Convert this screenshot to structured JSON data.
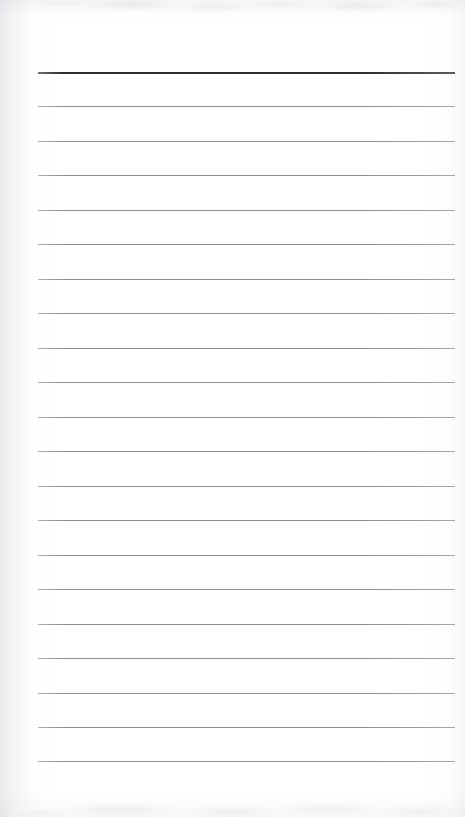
{
  "document": {
    "kind": "scanned-ruled-notepad-page",
    "title": "Blank Ruled Page",
    "page_width": 465,
    "page_height": 817,
    "content_text": "",
    "is_blank": true,
    "colors": {
      "paper": "#ffffff",
      "paper_tint_edge": "#f4f4f6",
      "rule_line": "#8d8d95",
      "header_rule_line": "#2e2e33",
      "scan_artifact": "#92929c"
    },
    "ruling": {
      "line_count": 21,
      "left_margin_px": 38,
      "right_margin_px": 455,
      "first_line_y": 72,
      "line_spacing_px": 34.5,
      "header_rule_index": 0,
      "header_rule_thickness_px": 2,
      "body_rule_thickness_px": 1,
      "lines": [
        {
          "index": 0,
          "y": 72,
          "thickness": 2,
          "color": "#2e2e33",
          "emphasis": "header"
        },
        {
          "index": 1,
          "y": 106,
          "thickness": 1,
          "color": "#8d8d95",
          "emphasis": "body"
        },
        {
          "index": 2,
          "y": 141,
          "thickness": 1,
          "color": "#8d8d95",
          "emphasis": "body"
        },
        {
          "index": 3,
          "y": 175,
          "thickness": 1,
          "color": "#8d8d95",
          "emphasis": "body"
        },
        {
          "index": 4,
          "y": 210,
          "thickness": 1,
          "color": "#8d8d95",
          "emphasis": "body"
        },
        {
          "index": 5,
          "y": 244,
          "thickness": 1,
          "color": "#8d8d95",
          "emphasis": "body"
        },
        {
          "index": 6,
          "y": 279,
          "thickness": 1,
          "color": "#8d8d95",
          "emphasis": "body"
        },
        {
          "index": 7,
          "y": 313,
          "thickness": 1,
          "color": "#8d8d95",
          "emphasis": "body"
        },
        {
          "index": 8,
          "y": 348,
          "thickness": 1,
          "color": "#8d8d95",
          "emphasis": "body"
        },
        {
          "index": 9,
          "y": 382,
          "thickness": 1,
          "color": "#8d8d95",
          "emphasis": "body"
        },
        {
          "index": 10,
          "y": 417,
          "thickness": 1,
          "color": "#8d8d95",
          "emphasis": "body"
        },
        {
          "index": 11,
          "y": 451,
          "thickness": 1,
          "color": "#8d8d95",
          "emphasis": "body"
        },
        {
          "index": 12,
          "y": 486,
          "thickness": 1,
          "color": "#8d8d95",
          "emphasis": "body"
        },
        {
          "index": 13,
          "y": 520,
          "thickness": 1,
          "color": "#8d8d95",
          "emphasis": "body"
        },
        {
          "index": 14,
          "y": 555,
          "thickness": 1,
          "color": "#8d8d95",
          "emphasis": "body"
        },
        {
          "index": 15,
          "y": 589,
          "thickness": 1,
          "color": "#8d8d95",
          "emphasis": "body"
        },
        {
          "index": 16,
          "y": 624,
          "thickness": 1,
          "color": "#8d8d95",
          "emphasis": "body"
        },
        {
          "index": 17,
          "y": 658,
          "thickness": 1,
          "color": "#8d8d95",
          "emphasis": "body"
        },
        {
          "index": 18,
          "y": 693,
          "thickness": 1,
          "color": "#8d8d95",
          "emphasis": "body"
        },
        {
          "index": 19,
          "y": 727,
          "thickness": 1,
          "color": "#8d8d95",
          "emphasis": "body"
        },
        {
          "index": 20,
          "y": 761,
          "thickness": 1,
          "color": "#8d8d95",
          "emphasis": "body"
        }
      ]
    }
  }
}
